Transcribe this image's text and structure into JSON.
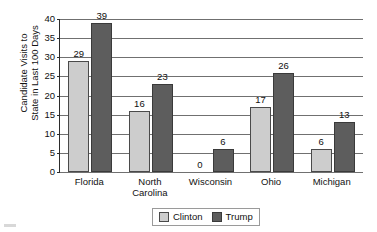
{
  "chart_data": {
    "type": "bar",
    "title": "",
    "xlabel": "",
    "ylabel": "Candidate Visits to State in Last 100 Days",
    "ylabel_lines": [
      "Candidate Visits to",
      "State in Last 100 Days"
    ],
    "categories": [
      "Florida",
      "North\nCarolina",
      "Wisconsin",
      "Ohio",
      "Michigan"
    ],
    "series": [
      {
        "name": "Clinton",
        "color": "#cdcdcd",
        "values": [
          29,
          16,
          0,
          17,
          6
        ]
      },
      {
        "name": "Trump",
        "color": "#5d5d5d",
        "values": [
          39,
          23,
          6,
          26,
          13
        ]
      }
    ],
    "ylim": [
      0,
      40
    ],
    "ytick_step": 5,
    "yticks": [
      0,
      5,
      10,
      15,
      20,
      25,
      30,
      35,
      40
    ],
    "ytick_labels": [
      "0",
      "5",
      "10",
      "15",
      "20",
      "25",
      "30",
      "35",
      "40"
    ],
    "grid": true,
    "grid_axis": "y",
    "legend_position": "bottom-center",
    "data_labels": true,
    "data_label_values": {
      "Clinton": [
        "29",
        "16",
        "0",
        "17",
        "6"
      ],
      "Trump": [
        "39",
        "23",
        "6",
        "26",
        "13"
      ]
    }
  },
  "legend": {
    "items": [
      {
        "label": "Clinton",
        "swatch": "legend-swatch-clinton"
      },
      {
        "label": "Trump",
        "swatch": "legend-swatch-trump"
      }
    ]
  }
}
